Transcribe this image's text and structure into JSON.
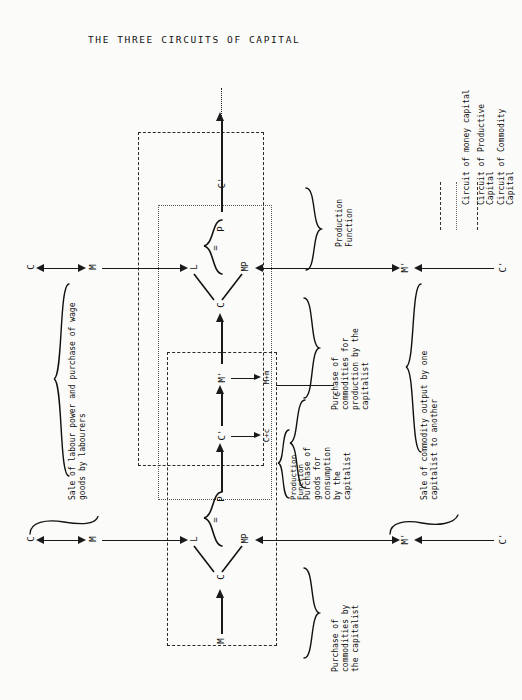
{
  "title": "THE THREE CIRCUITS OF CAPITAL",
  "legend": {
    "items": [
      {
        "label": "Circuit of money capital",
        "style": "dash-dot",
        "color": "#333333"
      },
      {
        "label": "Circuit of Productive Capital",
        "style": "dotted",
        "color": "#666666"
      },
      {
        "label": "Circuit of Commodity Capital",
        "style": "dash-dot",
        "color": "#333333"
      }
    ]
  },
  "nodes": {
    "top_C_left": "C",
    "top_M_left": "M",
    "top_L": "L",
    "top_MP": "MP",
    "top_C_center": "C",
    "top_P": "P",
    "top_eq": "=",
    "top_Cprime": "C'",
    "top_Mprime": "M'",
    "top_Cprime_right": "C'",
    "mid_Cprime": "C'",
    "mid_Mprime": "M'",
    "mid_Cplusc": "C+c",
    "mid_Mplusm": "M+m",
    "mid_P": "P",
    "mid_c": "c",
    "bot_C_left": "C",
    "bot_M_left": "M",
    "bot_L": "L",
    "bot_MP": "MP",
    "bot_C_center": "C",
    "bot_M": "M",
    "bot_eq": "=",
    "bot_Mprime": "M'",
    "bot_Cprime_right": "C'"
  },
  "annotations": {
    "production_function": "Production\nFunction",
    "production_function_l1": "Production",
    "production_function_l2": "Function",
    "purchase_production_top_l1": "Purchase of",
    "purchase_production_top_l2": "commodities for",
    "purchase_production_top_l3": "production by the",
    "purchase_production_top_l4": "capitalist",
    "purchase_consumption_l1": "Purchase of",
    "purchase_consumption_l2": "goods for",
    "purchase_consumption_l3": "consumption",
    "purchase_consumption_l4": "by the",
    "purchase_consumption_l5": "capitalist",
    "sale_labour_l1": "Sale of labour power and purchase of wage",
    "sale_labour_l2": "goods by labourers",
    "sale_commodity_l1": "Sale of commodity output by one",
    "sale_commodity_l2": "capitalist to another",
    "purchase_production_bot_l1": "Purchase of",
    "purchase_production_bot_l2": "commodities by",
    "purchase_production_bot_l3": "the capitalist",
    "production_function_2_l1": "Production",
    "production_function_2_l2": "Function"
  }
}
